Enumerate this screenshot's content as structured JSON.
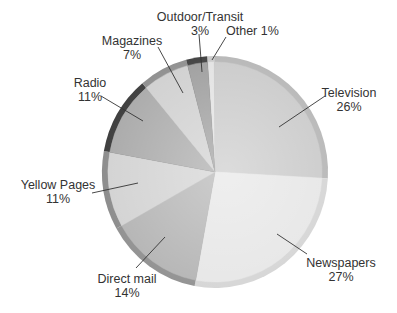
{
  "chart_data": {
    "type": "pie",
    "title": "",
    "start_angle_deg": -4,
    "direction": "clockwise",
    "slices": [
      {
        "label": "Other",
        "value": 1,
        "pct_text": "1%",
        "color": "#e2e2e2",
        "rim": "#c8c8c8"
      },
      {
        "label": "Television",
        "value": 26,
        "pct_text": "26%",
        "color": "#c9c9c9",
        "rim": "#b5b5b5"
      },
      {
        "label": "Newspapers",
        "value": 27,
        "pct_text": "27%",
        "color": "#e6e6e6",
        "rim": "#d4d4d4"
      },
      {
        "label": "Direct mail",
        "value": 14,
        "pct_text": "14%",
        "color": "#b3b3b3",
        "rim": "#8f8f8f"
      },
      {
        "label": "Yellow Pages",
        "value": 11,
        "pct_text": "11%",
        "color": "#d2d2d2",
        "rim": "#8a8a8a"
      },
      {
        "label": "Radio",
        "value": 11,
        "pct_text": "11%",
        "color": "#a8a8a8",
        "rim": "#3a3a3a"
      },
      {
        "label": "Magazines",
        "value": 7,
        "pct_text": "7%",
        "color": "#cfcfcf",
        "rim": "#8d8d8d"
      },
      {
        "label": "Outdoor/Transit",
        "value": 3,
        "pct_text": "3%",
        "color": "#9c9c9c",
        "rim": "#3c3c3c"
      }
    ],
    "legend": "none",
    "annotations": "leader lines from labels to slices"
  },
  "labels": {
    "other": {
      "name": "Other",
      "pct": "1%",
      "inline": "Other 1%"
    },
    "television": {
      "name": "Television",
      "pct": "26%"
    },
    "newspapers": {
      "name": "Newspapers",
      "pct": "27%"
    },
    "direct_mail": {
      "name": "Direct mail",
      "pct": "14%"
    },
    "yellow_pages": {
      "name": "Yellow Pages",
      "pct": "11%"
    },
    "radio": {
      "name": "Radio",
      "pct": "11%"
    },
    "magazines": {
      "name": "Magazines",
      "pct": "7%"
    },
    "outdoor": {
      "name": "Outdoor/Transit",
      "pct": "3%"
    }
  }
}
